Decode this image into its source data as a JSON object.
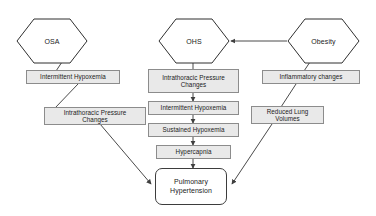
{
  "diagram": {
    "background_color": "#ffffff",
    "box_fill_color": "#e9e9e9",
    "box_border_color": "#8c8c8c",
    "edge_color": "#4a4a4a",
    "terminal_border_color": "#3d3d3d",
    "nodes": {
      "osa": {
        "label": "OSA",
        "shape": "hexagon"
      },
      "ohs": {
        "label": "OHS",
        "shape": "hexagon"
      },
      "obesity": {
        "label": "Obesity",
        "shape": "hexagon"
      },
      "intermittent_hypoxemia_left": {
        "label": "Intermittent Hypoxemia",
        "shape": "rectangle"
      },
      "intrathoracic_pressure_changes_left": {
        "label": "Intrathoracic Pressure\nChanges",
        "shape": "rectangle"
      },
      "intrathoracic_pressure_changes_center": {
        "label": "Intrathoracic Pressure\nChanges",
        "shape": "rectangle"
      },
      "intermittent_hypoxemia_center": {
        "label": "Intermittent Hypoxemia",
        "shape": "rectangle"
      },
      "sustained_hypoxemia": {
        "label": "Sustained Hypoxemia",
        "shape": "rectangle"
      },
      "hypercapnia": {
        "label": "Hypercapnia",
        "shape": "rectangle"
      },
      "inflammatory_changes": {
        "label": "Inflammatory changes",
        "shape": "rectangle"
      },
      "reduced_lung_volumes": {
        "label": "Reduced Lung\nVolumes",
        "shape": "rectangle"
      },
      "pulmonary_hypertension": {
        "label": "Pulmonary\nHypertension",
        "shape": "rounded-rectangle"
      }
    },
    "edges": [
      {
        "from": "osa",
        "to": "intermittent_hypoxemia_left",
        "arrowhead": false
      },
      {
        "from": "intermittent_hypoxemia_left",
        "to": "intrathoracic_pressure_changes_left",
        "arrowhead": false
      },
      {
        "from": "intrathoracic_pressure_changes_left",
        "to": "pulmonary_hypertension",
        "arrowhead": true
      },
      {
        "from": "obesity",
        "to": "ohs",
        "arrowhead": true
      },
      {
        "from": "ohs",
        "to": "intrathoracic_pressure_changes_center",
        "arrowhead": false
      },
      {
        "from": "intrathoracic_pressure_changes_center",
        "to": "intermittent_hypoxemia_center",
        "arrowhead": true
      },
      {
        "from": "intermittent_hypoxemia_center",
        "to": "sustained_hypoxemia",
        "arrowhead": true
      },
      {
        "from": "sustained_hypoxemia",
        "to": "hypercapnia",
        "arrowhead": true
      },
      {
        "from": "hypercapnia",
        "to": "pulmonary_hypertension",
        "arrowhead": true
      },
      {
        "from": "obesity",
        "to": "inflammatory_changes",
        "arrowhead": false
      },
      {
        "from": "inflammatory_changes",
        "to": "reduced_lung_volumes",
        "arrowhead": false
      },
      {
        "from": "reduced_lung_volumes",
        "to": "pulmonary_hypertension",
        "arrowhead": true
      }
    ]
  }
}
